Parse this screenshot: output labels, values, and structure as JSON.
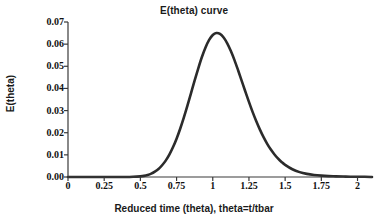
{
  "chart_data": {
    "type": "line",
    "title": "E(theta) curve",
    "xlabel": "Reduced time (theta), theta=t/tbar",
    "ylabel": "E(theta)",
    "xlim": [
      0,
      2.1
    ],
    "ylim": [
      0,
      0.07
    ],
    "grid": false,
    "legend": null,
    "xticks": [
      "0",
      "0.25",
      "0.5",
      "0.75",
      "1",
      "1.25",
      "1.5",
      "1.75",
      "2"
    ],
    "xtick_values": [
      0,
      0.25,
      0.5,
      0.75,
      1,
      1.25,
      1.5,
      1.75,
      2
    ],
    "yticks": [
      "0.00",
      "0.01",
      "0.02",
      "0.03",
      "0.04",
      "0.05",
      "0.06",
      "0.07"
    ],
    "ytick_values": [
      0,
      0.01,
      0.02,
      0.03,
      0.04,
      0.05,
      0.06,
      0.07
    ],
    "series": [
      {
        "name": "E(theta)",
        "color": "#2b2b2b",
        "line_width": 2.6,
        "x": [
          0,
          0.05,
          0.1,
          0.15,
          0.2,
          0.25,
          0.3,
          0.35,
          0.4,
          0.45,
          0.5,
          0.525,
          0.55,
          0.575,
          0.6,
          0.625,
          0.65,
          0.675,
          0.7,
          0.725,
          0.75,
          0.775,
          0.8,
          0.825,
          0.85,
          0.875,
          0.9,
          0.925,
          0.95,
          0.975,
          1,
          1.025,
          1.05,
          1.075,
          1.1,
          1.125,
          1.15,
          1.175,
          1.2,
          1.225,
          1.25,
          1.275,
          1.3,
          1.325,
          1.35,
          1.375,
          1.4,
          1.425,
          1.45,
          1.475,
          1.5,
          1.55,
          1.6,
          1.65,
          1.7,
          1.75,
          1.8,
          1.85,
          1.9,
          1.95,
          2,
          2.05,
          2.1
        ],
        "y": [
          0,
          0,
          0,
          0,
          0,
          0,
          0,
          0,
          0,
          0.0001,
          0.0003,
          0.0005,
          0.0009,
          0.0015,
          0.0024,
          0.0036,
          0.0053,
          0.0074,
          0.0101,
          0.0134,
          0.0173,
          0.0218,
          0.0268,
          0.0322,
          0.0379,
          0.0436,
          0.0491,
          0.0542,
          0.0585,
          0.0619,
          0.0641,
          0.065,
          0.0646,
          0.063,
          0.0604,
          0.0569,
          0.0528,
          0.0482,
          0.0434,
          0.0386,
          0.0339,
          0.0294,
          0.0253,
          0.0215,
          0.0181,
          0.0151,
          0.0125,
          0.0103,
          0.0084,
          0.0068,
          0.0055,
          0.0035,
          0.0022,
          0.0014,
          0.0009,
          0.0006,
          0.0004,
          0.0003,
          0.0002,
          0.0001,
          0.0001,
          0.0001,
          0
        ],
        "peak": {
          "x": 1,
          "y": 0.065
        }
      }
    ]
  },
  "axis": {
    "color": "#3a3a3a",
    "width": 1.2,
    "tick_length": 4
  },
  "background": "#ffffff"
}
